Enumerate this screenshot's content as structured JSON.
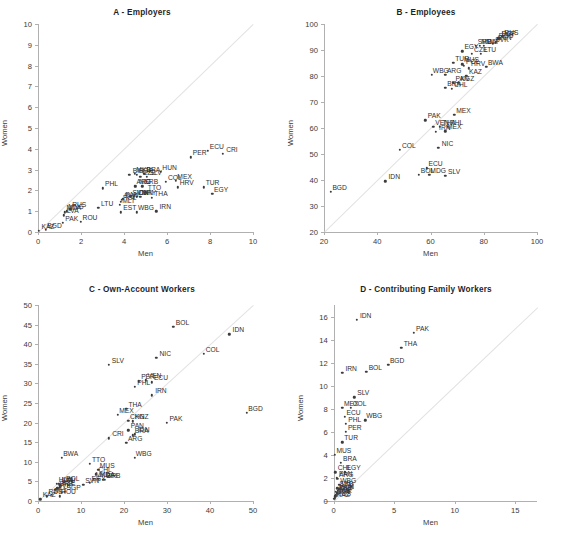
{
  "figure": {
    "panels": [
      {
        "id": "A",
        "title": "A - Employers",
        "xlabel": "Men",
        "ylabel": "Women",
        "xlim": [
          0,
          10
        ],
        "ylim": [
          0,
          10
        ],
        "xticks": [
          0,
          2,
          4,
          6,
          8,
          10
        ],
        "yticks": [
          0,
          1,
          2,
          3,
          4,
          5,
          6,
          7,
          8,
          9,
          10
        ],
        "points": [
          {
            "label": "KAZ",
            "x": 0.05,
            "y": 0.05
          },
          {
            "label": "BGD",
            "x": 0.35,
            "y": 0.12
          },
          {
            "label": "PAK",
            "x": 1.15,
            "y": 0.45
          },
          {
            "label": "LVA",
            "x": 1.2,
            "y": 0.8
          },
          {
            "label": "MDA",
            "x": 1.25,
            "y": 0.95
          },
          {
            "label": "MNG",
            "x": 1.35,
            "y": 1.0
          },
          {
            "label": "RUS",
            "x": 1.5,
            "y": 1.1
          },
          {
            "label": "ROU",
            "x": 2.0,
            "y": 0.5
          },
          {
            "label": "LTU",
            "x": 2.8,
            "y": 1.15
          },
          {
            "label": "PHL",
            "x": 3.0,
            "y": 2.1
          },
          {
            "label": "EST",
            "x": 3.85,
            "y": 0.95
          },
          {
            "label": "MLT",
            "x": 3.8,
            "y": 1.3
          },
          {
            "label": "POL",
            "x": 3.85,
            "y": 1.45
          },
          {
            "label": "SVK",
            "x": 3.9,
            "y": 1.55
          },
          {
            "label": "PAN",
            "x": 3.95,
            "y": 1.6
          },
          {
            "label": "SVN",
            "x": 4.3,
            "y": 1.7
          },
          {
            "label": "IDN",
            "x": 4.45,
            "y": 1.7
          },
          {
            "label": "CHN",
            "x": 4.6,
            "y": 1.7
          },
          {
            "label": "URY",
            "x": 4.75,
            "y": 1.7
          },
          {
            "label": "THA",
            "x": 5.3,
            "y": 1.65
          },
          {
            "label": "TTO",
            "x": 5.0,
            "y": 1.9
          },
          {
            "label": "ARG",
            "x": 4.5,
            "y": 2.2
          },
          {
            "label": "SRB",
            "x": 4.85,
            "y": 2.2
          },
          {
            "label": "NIC",
            "x": 4.55,
            "y": 2.2
          },
          {
            "label": "BIH",
            "x": 4.25,
            "y": 2.75
          },
          {
            "label": "MKD",
            "x": 4.5,
            "y": 2.8
          },
          {
            "label": "SGP",
            "x": 4.6,
            "y": 2.75
          },
          {
            "label": "BRA",
            "x": 4.95,
            "y": 2.8
          },
          {
            "label": "CZE",
            "x": 4.75,
            "y": 2.65
          },
          {
            "label": "SLV",
            "x": 5.05,
            "y": 2.65
          },
          {
            "label": "HUN",
            "x": 5.7,
            "y": 2.9
          },
          {
            "label": "COL",
            "x": 5.95,
            "y": 2.4
          },
          {
            "label": "MEX",
            "x": 6.4,
            "y": 2.45
          },
          {
            "label": "HRV",
            "x": 6.5,
            "y": 2.15
          },
          {
            "label": "IRN",
            "x": 5.5,
            "y": 1.0
          },
          {
            "label": "WBG",
            "x": 4.6,
            "y": 0.95
          },
          {
            "label": "TUR",
            "x": 7.7,
            "y": 2.15
          },
          {
            "label": "EGY",
            "x": 8.1,
            "y": 1.85
          },
          {
            "label": "PER",
            "x": 7.1,
            "y": 3.6
          },
          {
            "label": "ECU",
            "x": 7.9,
            "y": 3.9
          },
          {
            "label": "CRI",
            "x": 8.6,
            "y": 3.75
          }
        ]
      },
      {
        "id": "B",
        "title": "B - Employees",
        "xlabel": "Men",
        "ylabel": "Women",
        "xlim": [
          20,
          100
        ],
        "ylim": [
          20,
          100
        ],
        "xticks": [
          20,
          40,
          60,
          80,
          100
        ],
        "yticks": [
          20,
          30,
          40,
          50,
          60,
          70,
          80,
          90,
          100
        ],
        "points": [
          {
            "label": "BGD",
            "x": 22.5,
            "y": 35.5
          },
          {
            "label": "IDN",
            "x": 43.0,
            "y": 39.5
          },
          {
            "label": "BOL",
            "x": 55.5,
            "y": 42.0
          },
          {
            "label": "MDG",
            "x": 59.5,
            "y": 42.0
          },
          {
            "label": "ECU",
            "x": 58.5,
            "y": 44.5
          },
          {
            "label": "SLV",
            "x": 65.5,
            "y": 41.5
          },
          {
            "label": "COL",
            "x": 48.5,
            "y": 51.5
          },
          {
            "label": "NIC",
            "x": 63.0,
            "y": 52.5
          },
          {
            "label": "IRN",
            "x": 62.0,
            "y": 58.5
          },
          {
            "label": "MEX",
            "x": 65.5,
            "y": 58.8
          },
          {
            "label": "VEN",
            "x": 61.0,
            "y": 60.5
          },
          {
            "label": "THA",
            "x": 63.5,
            "y": 60.5
          },
          {
            "label": "PHL",
            "x": 66.5,
            "y": 60.5
          },
          {
            "label": "PAK",
            "x": 58.0,
            "y": 63.0
          },
          {
            "label": "MEX2",
            "x": 69.0,
            "y": 65.0
          },
          {
            "label": "BRA",
            "x": 65.5,
            "y": 75.5
          },
          {
            "label": "CHL",
            "x": 68.0,
            "y": 75.0
          },
          {
            "label": "PAN",
            "x": 68.5,
            "y": 77.5
          },
          {
            "label": "KGZ",
            "x": 70.5,
            "y": 77.5
          },
          {
            "label": "WBG",
            "x": 60.5,
            "y": 80.5
          },
          {
            "label": "ARG",
            "x": 65.5,
            "y": 80.5
          },
          {
            "label": "KAZ",
            "x": 73.5,
            "y": 80.0
          },
          {
            "label": "HRV",
            "x": 74.5,
            "y": 83.0
          },
          {
            "label": "TUR",
            "x": 68.5,
            "y": 85.0
          },
          {
            "label": "MUS",
            "x": 72.0,
            "y": 84.5
          },
          {
            "label": "POL",
            "x": 72.5,
            "y": 84.0
          },
          {
            "label": "BWA",
            "x": 81.0,
            "y": 83.5
          },
          {
            "label": "EGY",
            "x": 72.0,
            "y": 89.5
          },
          {
            "label": "CZE",
            "x": 75.5,
            "y": 88.5
          },
          {
            "label": "LTU",
            "x": 79.0,
            "y": 88.5
          },
          {
            "label": "SRB",
            "x": 77.0,
            "y": 91.5
          },
          {
            "label": "MDA",
            "x": 78.5,
            "y": 91.5
          },
          {
            "label": "MLT",
            "x": 80.0,
            "y": 91.5
          },
          {
            "label": "SVK",
            "x": 83.5,
            "y": 92.5
          },
          {
            "label": "SVN",
            "x": 84.5,
            "y": 93.0
          },
          {
            "label": "ROU",
            "x": 85.0,
            "y": 94.0
          },
          {
            "label": "LVA",
            "x": 85.5,
            "y": 94.5
          },
          {
            "label": "RUS",
            "x": 87.0,
            "y": 95.0
          },
          {
            "label": "SGP",
            "x": 86.0,
            "y": 94.5
          }
        ]
      },
      {
        "id": "C",
        "title": "C - Own-Account Workers",
        "xlabel": "Men",
        "ylabel": "Women",
        "xlim": [
          0,
          50
        ],
        "ylim": [
          0,
          50
        ],
        "xticks": [
          0,
          10,
          20,
          30,
          40,
          50
        ],
        "yticks": [
          0,
          5,
          10,
          15,
          20,
          25,
          30,
          35,
          40,
          45,
          50
        ],
        "points": [
          {
            "label": "KAZ",
            "x": 0.5,
            "y": 0.4
          },
          {
            "label": "RUS",
            "x": 2.0,
            "y": 1.2
          },
          {
            "label": "MLT",
            "x": 3.2,
            "y": 1.6
          },
          {
            "label": "ROU",
            "x": 5.0,
            "y": 1.2
          },
          {
            "label": "SVK",
            "x": 4.0,
            "y": 2.8
          },
          {
            "label": "SRB",
            "x": 4.5,
            "y": 3.2
          },
          {
            "label": "CZE",
            "x": 5.0,
            "y": 3.5
          },
          {
            "label": "SGP",
            "x": 6.2,
            "y": 2.4
          },
          {
            "label": "HUN",
            "x": 4.4,
            "y": 4.4
          },
          {
            "label": "LVA",
            "x": 4.8,
            "y": 4.4
          },
          {
            "label": "POL",
            "x": 6.0,
            "y": 4.6
          },
          {
            "label": "LTU",
            "x": 5.2,
            "y": 4.0
          },
          {
            "label": "BWA",
            "x": 5.5,
            "y": 11.0
          },
          {
            "label": "SVN",
            "x": 10.5,
            "y": 4.2
          },
          {
            "label": "TTO",
            "x": 12.0,
            "y": 9.5
          },
          {
            "label": "MUS",
            "x": 14.0,
            "y": 8.0
          },
          {
            "label": "CHL",
            "x": 13.5,
            "y": 6.8
          },
          {
            "label": "MKD",
            "x": 13.0,
            "y": 5.6
          },
          {
            "label": "MDA",
            "x": 14.0,
            "y": 5.6
          },
          {
            "label": "BIH",
            "x": 15.0,
            "y": 5.4
          },
          {
            "label": "SRB2",
            "x": 15.5,
            "y": 5.4
          },
          {
            "label": "EGY",
            "x": 12.0,
            "y": 4.6
          },
          {
            "label": "CRI",
            "x": 16.5,
            "y": 16.0
          },
          {
            "label": "MEX",
            "x": 18.5,
            "y": 22.0
          },
          {
            "label": "THA",
            "x": 20.5,
            "y": 23.5
          },
          {
            "label": "CHN",
            "x": 21.0,
            "y": 20.5
          },
          {
            "label": "KGZ",
            "x": 22.0,
            "y": 20.3
          },
          {
            "label": "PAN",
            "x": 21.0,
            "y": 18.0
          },
          {
            "label": "BRA",
            "x": 22.0,
            "y": 16.8
          },
          {
            "label": "IDN2",
            "x": 22.5,
            "y": 17.0
          },
          {
            "label": "ARG",
            "x": 20.5,
            "y": 14.8
          },
          {
            "label": "WBG",
            "x": 22.5,
            "y": 11.0
          },
          {
            "label": "PAK",
            "x": 30.0,
            "y": 20.0
          },
          {
            "label": "SLV",
            "x": 16.5,
            "y": 34.8
          },
          {
            "label": "PHL",
            "x": 22.5,
            "y": 29.2
          },
          {
            "label": "PER",
            "x": 23.5,
            "y": 30.5
          },
          {
            "label": "VEN",
            "x": 25.0,
            "y": 30.8
          },
          {
            "label": "ECU",
            "x": 26.5,
            "y": 30.3
          },
          {
            "label": "IRN",
            "x": 26.5,
            "y": 27.0
          },
          {
            "label": "NIC",
            "x": 27.5,
            "y": 36.5
          },
          {
            "label": "COL",
            "x": 38.5,
            "y": 37.5
          },
          {
            "label": "BOL",
            "x": 31.5,
            "y": 44.5
          },
          {
            "label": "IDN",
            "x": 44.5,
            "y": 42.5
          },
          {
            "label": "BGD",
            "x": 48.5,
            "y": 22.5
          }
        ]
      },
      {
        "id": "D",
        "title": "D - Contributing Family Workers",
        "xlabel": "Men",
        "ylabel": "Women",
        "xlim": [
          -0.8,
          16.8
        ],
        "ylim": [
          0,
          17
        ],
        "xticks": [
          0,
          5,
          10,
          15
        ],
        "yticks": [
          0,
          2,
          4,
          6,
          8,
          10,
          12,
          14,
          16
        ],
        "points": [
          {
            "label": "KAZ",
            "x": 0.05,
            "y": 0.2
          },
          {
            "label": "RUS",
            "x": 0.1,
            "y": 0.3
          },
          {
            "label": "LVA",
            "x": 0.15,
            "y": 0.4
          },
          {
            "label": "SVK",
            "x": 0.2,
            "y": 0.5
          },
          {
            "label": "SGP",
            "x": 0.25,
            "y": 0.6
          },
          {
            "label": "MLT",
            "x": 0.3,
            "y": 0.7
          },
          {
            "label": "CZE",
            "x": 0.2,
            "y": 0.8
          },
          {
            "label": "HUN",
            "x": 0.35,
            "y": 0.9
          },
          {
            "label": "LTU",
            "x": 0.4,
            "y": 1.0
          },
          {
            "label": "SRB",
            "x": 0.3,
            "y": 1.1
          },
          {
            "label": "WBG2",
            "x": 0.45,
            "y": 1.4
          },
          {
            "label": "ARG",
            "x": 0.3,
            "y": 1.9
          },
          {
            "label": "PAN",
            "x": 0.25,
            "y": 2.0
          },
          {
            "label": "CHL",
            "x": 0.15,
            "y": 2.5
          },
          {
            "label": "EGY",
            "x": 0.9,
            "y": 2.5
          },
          {
            "label": "BRA",
            "x": 0.6,
            "y": 3.3
          },
          {
            "label": "MUS",
            "x": 0.1,
            "y": 4.0
          },
          {
            "label": "TUR",
            "x": 0.7,
            "y": 5.1
          },
          {
            "label": "PER",
            "x": 1.0,
            "y": 6.0
          },
          {
            "label": "PHL",
            "x": 1.0,
            "y": 6.7
          },
          {
            "label": "ECU",
            "x": 0.9,
            "y": 7.3
          },
          {
            "label": "WBG",
            "x": 2.6,
            "y": 7.0
          },
          {
            "label": "MEX",
            "x": 0.7,
            "y": 8.1
          },
          {
            "label": "COL",
            "x": 1.4,
            "y": 8.1
          },
          {
            "label": "SLV",
            "x": 1.7,
            "y": 9.0
          },
          {
            "label": "IRN",
            "x": 0.7,
            "y": 11.1
          },
          {
            "label": "BOL",
            "x": 2.7,
            "y": 11.2
          },
          {
            "label": "BGD",
            "x": 4.5,
            "y": 11.8
          },
          {
            "label": "THA",
            "x": 5.6,
            "y": 13.3
          },
          {
            "label": "PAK",
            "x": 6.6,
            "y": 14.6
          },
          {
            "label": "IDN",
            "x": 1.9,
            "y": 15.7
          }
        ]
      }
    ]
  },
  "colors": {
    "axis": "#b0b0b0",
    "text": "#2e2e2e",
    "diagonal": "#e2e2e2",
    "marker": "#3c3c3c"
  }
}
